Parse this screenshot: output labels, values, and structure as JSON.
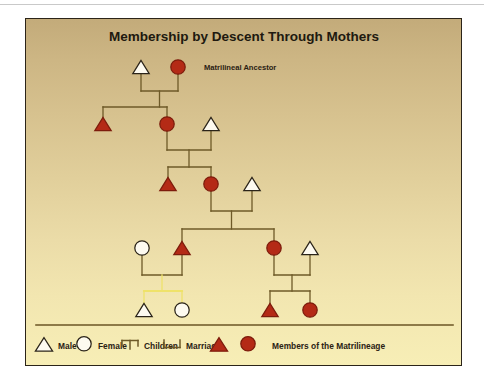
{
  "figure": {
    "title": "Membership by Descent Through Mothers",
    "annotation": "Matrilineal Ancestor",
    "colors": {
      "lineage_red": "#b42a16",
      "non_member_fill": "#fdfaf0",
      "link_line": "#6e5a28",
      "highlight_line": "#efe26a",
      "frame_border": "#2b2419",
      "text": "#20190f",
      "bg_top": "#c3ab7a",
      "bg_bottom": "#f7eeb6",
      "legend_rule": "#6b5524"
    },
    "legend": {
      "items": [
        {
          "icon": "triangle-outline-icon",
          "label": "Male"
        },
        {
          "icon": "circle-outline-icon",
          "label": "Female"
        },
        {
          "icon": "children-bracket-icon",
          "label": "Children"
        },
        {
          "icon": "marriage-bracket-icon",
          "label": "Marriage"
        },
        {
          "icon": "triangle-filled-icon",
          "label": ""
        },
        {
          "icon": "circle-filled-icon",
          "label": "Members of the Matrilineage"
        }
      ]
    },
    "persons": [
      {
        "id": "g1m",
        "generation": 1,
        "sex": "male",
        "member": false,
        "x": 115,
        "y": 48
      },
      {
        "id": "g1f",
        "generation": 1,
        "sex": "female",
        "member": true,
        "x": 152,
        "y": 48
      },
      {
        "id": "g2m",
        "generation": 2,
        "sex": "male",
        "member": true,
        "x": 77,
        "y": 105
      },
      {
        "id": "g2f",
        "generation": 2,
        "sex": "female",
        "member": true,
        "x": 141,
        "y": 105
      },
      {
        "id": "g2s",
        "generation": 2,
        "sex": "male",
        "member": false,
        "x": 185,
        "y": 105
      },
      {
        "id": "g3m",
        "generation": 3,
        "sex": "male",
        "member": true,
        "x": 142,
        "y": 165
      },
      {
        "id": "g3f",
        "generation": 3,
        "sex": "female",
        "member": true,
        "x": 185,
        "y": 165
      },
      {
        "id": "g3s",
        "generation": 3,
        "sex": "male",
        "member": false,
        "x": 226,
        "y": 165
      },
      {
        "id": "g4w",
        "generation": 4,
        "sex": "female",
        "member": false,
        "x": 116,
        "y": 229
      },
      {
        "id": "g4m",
        "generation": 4,
        "sex": "male",
        "member": true,
        "x": 156,
        "y": 229
      },
      {
        "id": "g4f",
        "generation": 4,
        "sex": "female",
        "member": true,
        "x": 248,
        "y": 229
      },
      {
        "id": "g4s",
        "generation": 4,
        "sex": "male",
        "member": false,
        "x": 284,
        "y": 229
      },
      {
        "id": "g5a",
        "generation": 5,
        "sex": "male",
        "member": false,
        "x": 118,
        "y": 291
      },
      {
        "id": "g5b",
        "generation": 5,
        "sex": "female",
        "member": false,
        "x": 156,
        "y": 291
      },
      {
        "id": "g5c",
        "generation": 5,
        "sex": "male",
        "member": true,
        "x": 244,
        "y": 291
      },
      {
        "id": "g5d",
        "generation": 5,
        "sex": "female",
        "member": true,
        "x": 284,
        "y": 291
      }
    ],
    "marriages": [
      {
        "id": "u1",
        "left": "g1m",
        "right": "g1f",
        "bar_y": 72,
        "highlight": false
      },
      {
        "id": "u2",
        "left": "g2f",
        "right": "g2s",
        "bar_y": 131,
        "highlight": false
      },
      {
        "id": "u3",
        "left": "g3f",
        "right": "g3s",
        "bar_y": 192,
        "highlight": false
      },
      {
        "id": "u4",
        "left": "g4w",
        "right": "g4m",
        "bar_y": 256,
        "highlight": false
      },
      {
        "id": "u5",
        "left": "g4f",
        "right": "g4s",
        "bar_y": 256,
        "highlight": false
      }
    ],
    "sibling_groups": [
      {
        "id": "s1",
        "union": "u1",
        "bar_y": 88,
        "children": [
          "g2m",
          "g2f"
        ],
        "highlight": false
      },
      {
        "id": "s2",
        "union": "u2",
        "bar_y": 148,
        "children": [
          "g3m",
          "g3f"
        ],
        "highlight": false
      },
      {
        "id": "s3",
        "union": "u3",
        "bar_y": 210,
        "children": [
          "g4m",
          "g4f"
        ],
        "highlight": false
      },
      {
        "id": "s4",
        "union": "u4",
        "bar_y": 272,
        "children": [
          "g5a",
          "g5b"
        ],
        "highlight": true
      },
      {
        "id": "s5",
        "union": "u5",
        "bar_y": 272,
        "children": [
          "g5c",
          "g5d"
        ],
        "highlight": false
      }
    ],
    "legend_rule_y": 306,
    "legend_row_y": 327
  }
}
